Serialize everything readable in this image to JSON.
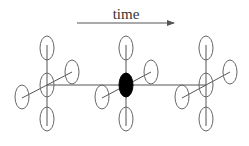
{
  "diagram": {
    "title": "time",
    "arrow": {
      "x1": 77,
      "y1": 23,
      "x2": 175,
      "y2": 23
    },
    "timeline": {
      "y": 85,
      "x1": 47,
      "x2": 206
    },
    "nodes": [
      {
        "id": "left",
        "cx": 47,
        "filled": false
      },
      {
        "id": "center",
        "cx": 126,
        "filled": true
      },
      {
        "id": "right",
        "cx": 206,
        "filled": false
      }
    ],
    "colors": {
      "line": "#555555",
      "ellipse": "#666666",
      "filled": "#000000",
      "background": "#ffffff"
    }
  }
}
